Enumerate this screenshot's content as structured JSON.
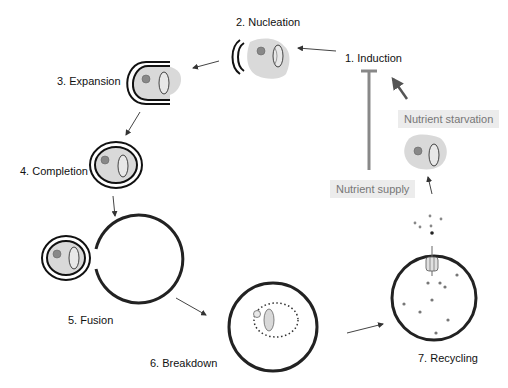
{
  "diagram": {
    "type": "autophagy-cycle",
    "steps": [
      {
        "id": 1,
        "label": "1. Induction"
      },
      {
        "id": 2,
        "label": "2. Nucleation"
      },
      {
        "id": 3,
        "label": "3. Expansion"
      },
      {
        "id": 4,
        "label": "4. Completion"
      },
      {
        "id": 5,
        "label": "5. Fusion"
      },
      {
        "id": 6,
        "label": "6. Breakdown"
      },
      {
        "id": 7,
        "label": "7. Recycling"
      }
    ],
    "regulators": {
      "starvation": "Nutrient starvation",
      "supply": "Nutrient supply"
    },
    "colors": {
      "membrane": "#1a1a1a",
      "cytoplasm": "#d9d9d9",
      "arrow": "#444444",
      "regulator_box": "#ececec",
      "regulator_text": "#777777"
    }
  }
}
